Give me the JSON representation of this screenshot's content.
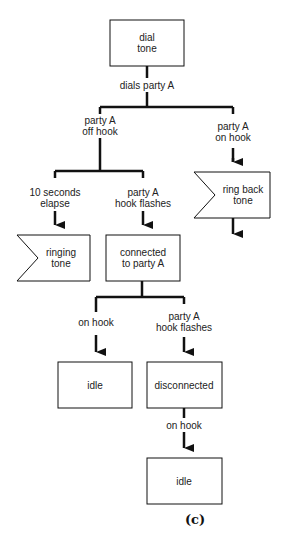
{
  "diagram": {
    "caption": "(c)",
    "nodes": [
      {
        "id": "dial_tone",
        "type": "state-box",
        "line1": "dial",
        "line2": "tone"
      },
      {
        "id": "ring_back_tone",
        "type": "signal-shape",
        "line1": "ring back",
        "line2": "tone"
      },
      {
        "id": "ringing_tone",
        "type": "signal-shape",
        "line1": "ringing",
        "line2": "tone"
      },
      {
        "id": "connected",
        "type": "state-box",
        "line1": "connected",
        "line2": "to party A"
      },
      {
        "id": "idle_1",
        "type": "state-box",
        "line1": "idle"
      },
      {
        "id": "disconnected",
        "type": "state-box",
        "line1": "disconnected"
      },
      {
        "id": "idle_2",
        "type": "state-box",
        "line1": "idle"
      }
    ],
    "edges": [
      {
        "from": "dial_tone",
        "label1": "dials party A"
      },
      {
        "from": "dials_party_A",
        "to": "off_hook_branch",
        "label1": "party A",
        "label2": "off hook"
      },
      {
        "from": "dials_party_A",
        "to": "ring_back_tone",
        "label1": "party A",
        "label2": "on hook"
      },
      {
        "from": "off_hook_branch",
        "to": "ringing_tone",
        "label1": "10 seconds",
        "label2": "elapse"
      },
      {
        "from": "off_hook_branch",
        "to": "connected",
        "label1": "party A",
        "label2": "hook flashes"
      },
      {
        "from": "connected",
        "to": "idle_1",
        "label1": "on hook"
      },
      {
        "from": "connected",
        "to": "disconnected",
        "label1": "party A",
        "label2": "hook flashes"
      },
      {
        "from": "disconnected",
        "to": "idle_2",
        "label1": "on hook"
      }
    ]
  }
}
